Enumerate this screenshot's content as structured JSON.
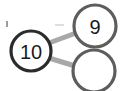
{
  "diagram": {
    "type": "number-bond",
    "background_color": "#ffffff",
    "nodes": [
      {
        "id": "whole",
        "name": "whole-node",
        "label": "10",
        "cx": 31,
        "cy": 51,
        "r": 20,
        "stroke_color": "#2b2b2b",
        "stroke_width": 3.2,
        "fill": "#ffffff",
        "filled": true
      },
      {
        "id": "part-top",
        "name": "part-node-top",
        "label": "9",
        "cx": 95,
        "cy": 26,
        "r": 21,
        "stroke_color": "#5d5d5d",
        "stroke_width": 3.2,
        "fill": "#ffffff",
        "filled": true
      },
      {
        "id": "part-bottom",
        "name": "part-node-bottom",
        "label": "",
        "cx": 94,
        "cy": 71,
        "r": 21,
        "stroke_color": "#5d5d5d",
        "stroke_width": 3.2,
        "fill": "#ffffff",
        "filled": false
      }
    ],
    "links": [
      {
        "id": "link-whole-top",
        "name": "link-whole-to-top",
        "from": "whole",
        "to": "part-top",
        "x1": 49,
        "y1": 43,
        "x2": 76,
        "y2": 33,
        "color": "#a8a8a8",
        "width": 5
      },
      {
        "id": "link-whole-bottom",
        "name": "link-whole-to-bottom",
        "from": "whole",
        "to": "part-bottom",
        "x1": 49,
        "y1": 58,
        "x2": 75,
        "y2": 66,
        "color": "#a8a8a8",
        "width": 5
      }
    ],
    "artifacts": [
      {
        "name": "stray-tick-mark",
        "description": "small dark tick at upper-left"
      },
      {
        "name": "faint-smudge",
        "description": "faint light-gray smudge above links"
      }
    ]
  }
}
